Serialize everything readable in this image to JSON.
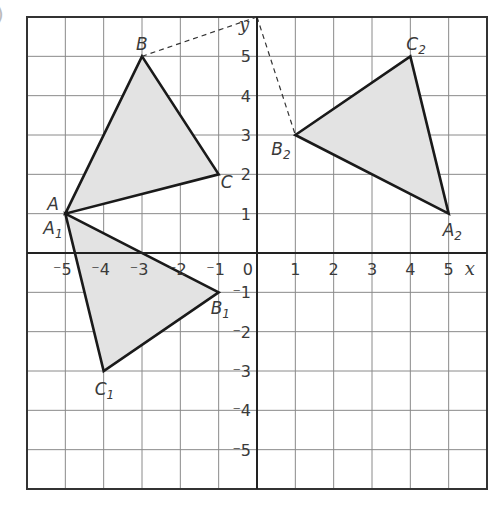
{
  "figure": {
    "corner_mark": ")",
    "axes": {
      "x_label": "x",
      "y_label": "y",
      "origin_label": "0",
      "x_ticks": [
        {
          "v": -5,
          "label": "⁻5"
        },
        {
          "v": -4,
          "label": "⁻4"
        },
        {
          "v": -3,
          "label": "⁻3"
        },
        {
          "v": -2,
          "label": "⁻2"
        },
        {
          "v": -1,
          "label": "⁻1"
        },
        {
          "v": 1,
          "label": "1"
        },
        {
          "v": 2,
          "label": "2"
        },
        {
          "v": 3,
          "label": "3"
        },
        {
          "v": 4,
          "label": "4"
        },
        {
          "v": 5,
          "label": "5"
        }
      ],
      "y_ticks": [
        {
          "v": 5,
          "label": "5"
        },
        {
          "v": 4,
          "label": "4"
        },
        {
          "v": 3,
          "label": "3"
        },
        {
          "v": 2,
          "label": "2"
        },
        {
          "v": 1,
          "label": "1"
        },
        {
          "v": -1,
          "label": "⁻1"
        },
        {
          "v": -2,
          "label": "⁻2"
        },
        {
          "v": -3,
          "label": "⁻3"
        },
        {
          "v": -4,
          "label": "⁻4"
        },
        {
          "v": -5,
          "label": "⁻5"
        }
      ],
      "range": {
        "xmin": -6,
        "xmax": 6,
        "ymin": -6,
        "ymax": 6
      }
    },
    "colors": {
      "grid": "#8a8a8a",
      "border": "#333333",
      "axis": "#222222",
      "edge": "#1a1a1a",
      "fill": "#e3e3e3",
      "dash": "#333333",
      "text": "#3a3a3a"
    },
    "triangles": [
      {
        "name": "ABC",
        "vertices": [
          {
            "label": "A",
            "sub": "",
            "x": -5,
            "y": 1
          },
          {
            "label": "B",
            "sub": "",
            "x": -3,
            "y": 5
          },
          {
            "label": "C",
            "sub": "",
            "x": -1,
            "y": 2
          }
        ]
      },
      {
        "name": "A1B1C1",
        "vertices": [
          {
            "label": "A",
            "sub": "1",
            "x": -5,
            "y": 1
          },
          {
            "label": "B",
            "sub": "1",
            "x": -1,
            "y": -1
          },
          {
            "label": "C",
            "sub": "1",
            "x": -4,
            "y": -3
          }
        ]
      },
      {
        "name": "A2B2C2",
        "vertices": [
          {
            "label": "A",
            "sub": "2",
            "x": 5,
            "y": 1
          },
          {
            "label": "B",
            "sub": "2",
            "x": 1,
            "y": 3
          },
          {
            "label": "C",
            "sub": "2",
            "x": 4,
            "y": 5
          }
        ]
      }
    ],
    "dashed_lines": [
      {
        "from": {
          "x": -3,
          "y": 5
        },
        "to": {
          "x": 0,
          "y": 6
        }
      },
      {
        "from": {
          "x": 0,
          "y": 6
        },
        "to": {
          "x": 1,
          "y": 3
        }
      }
    ],
    "vertex_labels": [
      {
        "text": "A",
        "sub": "",
        "x": -5,
        "y": 1,
        "dx": -18,
        "dy": -4
      },
      {
        "text": "A",
        "sub": "1",
        "x": -5,
        "y": 1,
        "dx": -22,
        "dy": 20
      },
      {
        "text": "B",
        "sub": "",
        "x": -3,
        "y": 5,
        "dx": -6,
        "dy": -6
      },
      {
        "text": "C",
        "sub": "",
        "x": -1,
        "y": 2,
        "dx": 2,
        "dy": 14
      },
      {
        "text": "B",
        "sub": "1",
        "x": -1,
        "y": -1,
        "dx": -8,
        "dy": 22
      },
      {
        "text": "C",
        "sub": "1",
        "x": -4,
        "y": -3,
        "dx": -9,
        "dy": 24
      },
      {
        "text": "A",
        "sub": "2",
        "x": 5,
        "y": 1,
        "dx": -6,
        "dy": 22
      },
      {
        "text": "B",
        "sub": "2",
        "x": 1,
        "y": 3,
        "dx": -24,
        "dy": 20
      },
      {
        "text": "C",
        "sub": "2",
        "x": 4,
        "y": 5,
        "dx": -4,
        "dy": -6
      }
    ]
  }
}
